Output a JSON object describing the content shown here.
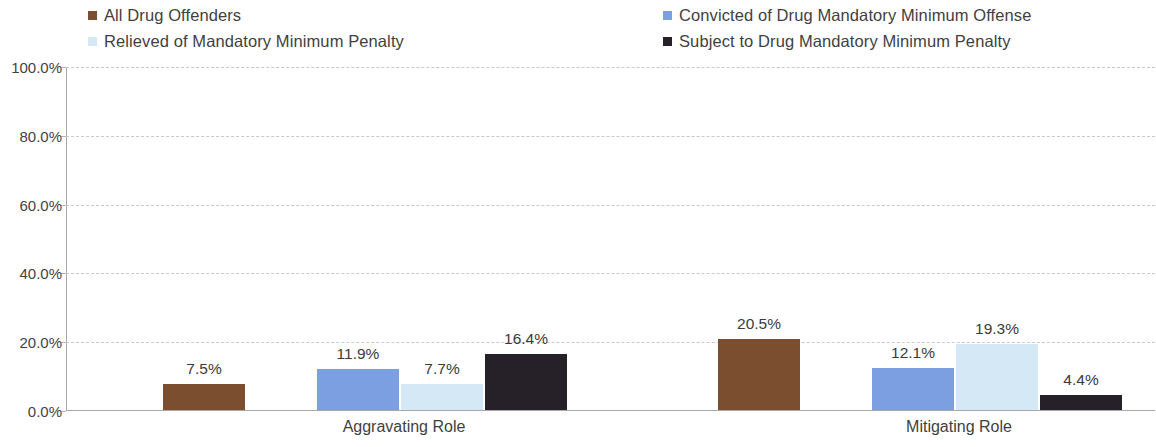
{
  "chart_data": {
    "type": "bar",
    "title": "",
    "subtitle": "",
    "xlabel": "",
    "ylabel": "",
    "ylim": [
      0,
      100
    ],
    "grid": true,
    "legend_position": "top",
    "categories": [
      "Aggravating Role",
      "Mitigating Role"
    ],
    "ytick_labels": [
      "0.0%",
      "20.0%",
      "40.0%",
      "60.0%",
      "80.0%",
      "100.0%"
    ],
    "ytick_values": [
      0,
      20,
      40,
      60,
      80,
      100
    ],
    "series": [
      {
        "name": "All Drug Offenders",
        "color": "#7B4E30",
        "values": [
          7.5,
          20.5
        ],
        "labels": [
          "7.5%",
          "20.5%"
        ]
      },
      {
        "name": "Convicted of Drug Mandatory Minimum Offense",
        "color": "#7B9FE0",
        "values": [
          11.9,
          12.1
        ],
        "labels": [
          "11.9%",
          "12.1%"
        ]
      },
      {
        "name": "Relieved of Mandatory Minimum Penalty",
        "color": "#D5E8F5",
        "values": [
          7.7,
          19.3
        ],
        "labels": [
          "7.7%",
          "19.3%"
        ]
      },
      {
        "name": "Subject to Drug Mandatory Minimum Penalty",
        "color": "#262029",
        "values": [
          16.4,
          4.4
        ],
        "labels": [
          "16.4%",
          "4.4%"
        ]
      }
    ]
  },
  "legend": {
    "items": [
      {
        "label": "All Drug Offenders",
        "color": "#7B4E30"
      },
      {
        "label": "Relieved of Mandatory Minimum Penalty",
        "color": "#D5E8F5"
      },
      {
        "label": "Convicted of Drug Mandatory Minimum Offense",
        "color": "#7B9FE0"
      },
      {
        "label": "Subject to Drug Mandatory Minimum Penalty",
        "color": "#262029"
      }
    ]
  }
}
